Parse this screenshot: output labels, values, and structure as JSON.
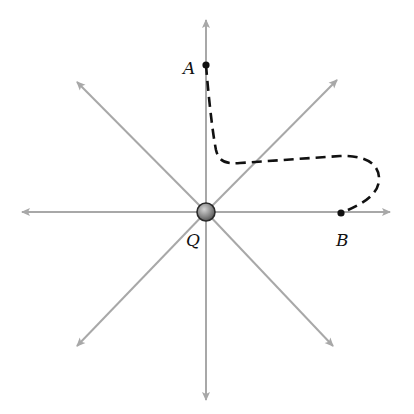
{
  "diagram": {
    "colors": {
      "field_line": "#a8a8a8",
      "path": "#111111",
      "charge_fill": "#8c8c8c",
      "charge_stroke": "#2a2a2a",
      "point": "#111111",
      "background": "#ffffff"
    },
    "charge": {
      "label": "Q",
      "x": 206,
      "y": 212,
      "r": 9
    },
    "points": [
      {
        "label": "A",
        "x": 206,
        "y": 65
      },
      {
        "label": "B",
        "x": 341,
        "y": 213
      }
    ],
    "field_lines": [
      {
        "direction": "up",
        "x2": 206,
        "y2": 20
      },
      {
        "direction": "down",
        "x2": 206,
        "y2": 400
      },
      {
        "direction": "left",
        "x2": 22,
        "y2": 212
      },
      {
        "direction": "right",
        "x2": 390,
        "y2": 212
      },
      {
        "direction": "up-right",
        "x2": 337,
        "y2": 80
      },
      {
        "direction": "up-left",
        "x2": 77,
        "y2": 82
      },
      {
        "direction": "down-left",
        "x2": 77,
        "y2": 346
      },
      {
        "direction": "down-right",
        "x2": 333,
        "y2": 346
      }
    ],
    "path": {
      "style": "dashed",
      "from": "A",
      "to": "B",
      "d": "M206,65 C208,90 212,130 216,150 C219,162 226,164 240,163 L340,156 C362,155 380,162 379,180 C378,196 360,205 341,213"
    }
  }
}
